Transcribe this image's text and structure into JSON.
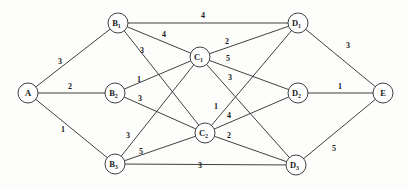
{
  "figure": {
    "type": "weighted-undirected-graph",
    "background_color": "#fdfdfc",
    "stroke_color": "#2b2b2b",
    "text_color": "#1a1a1a",
    "width": 409,
    "height": 190
  },
  "nodes": [
    {
      "id": "A",
      "label": "A",
      "sub": "",
      "x": 28,
      "y": 93,
      "r": 10
    },
    {
      "id": "B1",
      "label": "B",
      "sub": "1",
      "x": 118,
      "y": 23,
      "r": 10
    },
    {
      "id": "B2",
      "label": "B",
      "sub": "2",
      "x": 115,
      "y": 93,
      "r": 10
    },
    {
      "id": "B3",
      "label": "B",
      "sub": "3",
      "x": 115,
      "y": 164,
      "r": 10
    },
    {
      "id": "C1",
      "label": "C",
      "sub": "1",
      "x": 200,
      "y": 57,
      "r": 10
    },
    {
      "id": "C2",
      "label": "C",
      "sub": "2",
      "x": 205,
      "y": 133,
      "r": 10
    },
    {
      "id": "D1",
      "label": "D",
      "sub": "1",
      "x": 298,
      "y": 23,
      "r": 10
    },
    {
      "id": "D2",
      "label": "D",
      "sub": "2",
      "x": 298,
      "y": 93,
      "r": 10
    },
    {
      "id": "D3",
      "label": "D",
      "sub": "3",
      "x": 296,
      "y": 165,
      "r": 10
    },
    {
      "id": "E",
      "label": "E",
      "sub": "",
      "x": 383,
      "y": 93,
      "r": 10
    }
  ],
  "edges": [
    {
      "from": "A",
      "to": "B1",
      "weight": "3",
      "lx": 60,
      "ly": 61
    },
    {
      "from": "A",
      "to": "B2",
      "weight": "2",
      "lx": 70,
      "ly": 86
    },
    {
      "from": "A",
      "to": "B3",
      "weight": "1",
      "lx": 63,
      "ly": 129
    },
    {
      "from": "B1",
      "to": "D1",
      "weight": "4",
      "lx": 203,
      "ly": 15
    },
    {
      "from": "B1",
      "to": "C1",
      "weight": "4",
      "lx": 164,
      "ly": 34
    },
    {
      "from": "B1",
      "to": "C2",
      "weight": "3",
      "lx": 142,
      "ly": 50
    },
    {
      "from": "B2",
      "to": "C1",
      "weight": "1",
      "lx": 139,
      "ly": 79
    },
    {
      "from": "B2",
      "to": "C2",
      "weight": "3",
      "lx": 140,
      "ly": 98
    },
    {
      "from": "B3",
      "to": "C1",
      "weight": "3",
      "lx": 128,
      "ly": 135
    },
    {
      "from": "B3",
      "to": "C2",
      "weight": "5",
      "lx": 141,
      "ly": 151
    },
    {
      "from": "B3",
      "to": "D3",
      "weight": "3",
      "lx": 200,
      "ly": 165
    },
    {
      "from": "C1",
      "to": "D1",
      "weight": "2",
      "lx": 227,
      "ly": 41
    },
    {
      "from": "C1",
      "to": "D2",
      "weight": "5",
      "lx": 228,
      "ly": 58
    },
    {
      "from": "C1",
      "to": "D3",
      "weight": "3",
      "lx": 230,
      "ly": 77
    },
    {
      "from": "C2",
      "to": "D1",
      "weight": "1",
      "lx": 216,
      "ly": 106
    },
    {
      "from": "C2",
      "to": "D2",
      "weight": "4",
      "lx": 229,
      "ly": 115
    },
    {
      "from": "C2",
      "to": "D3",
      "weight": "2",
      "lx": 229,
      "ly": 135
    },
    {
      "from": "D1",
      "to": "E",
      "weight": "3",
      "lx": 348,
      "ly": 45
    },
    {
      "from": "D2",
      "to": "E",
      "weight": "1",
      "lx": 340,
      "ly": 86
    },
    {
      "from": "D3",
      "to": "E",
      "weight": "5",
      "lx": 334,
      "ly": 148
    }
  ]
}
